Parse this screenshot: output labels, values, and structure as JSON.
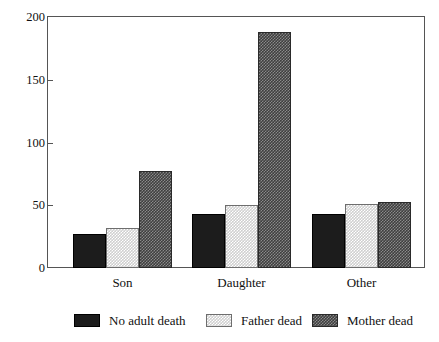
{
  "chart_data": {
    "type": "bar",
    "title": "",
    "xlabel": "",
    "ylabel": "",
    "categories": [
      "Son",
      "Daughter",
      "Other"
    ],
    "series": [
      {
        "name": "No adult death",
        "values": [
          27,
          43,
          43
        ],
        "color": "#1c1c1c",
        "fill": "solid-black"
      },
      {
        "name": "Father dead",
        "values": [
          32,
          50,
          51
        ],
        "color": "#cfcfcf",
        "fill": "light-gray-checker"
      },
      {
        "name": "Mother dead",
        "values": [
          77,
          188,
          53
        ],
        "color": "#3f3f3f",
        "fill": "dark-gray-checker"
      }
    ],
    "ylim": [
      0,
      200
    ],
    "yticks": [
      0,
      50,
      100,
      150,
      200
    ],
    "ytick_labels": [
      "0",
      "50",
      "100",
      "150",
      "200"
    ],
    "grid": false,
    "legend_position": "bottom"
  },
  "axis": {
    "ticks": [
      {
        "label": "200",
        "value": 200
      },
      {
        "label": "150",
        "value": 150
      },
      {
        "label": "100",
        "value": 100
      },
      {
        "label": "50",
        "value": 50
      },
      {
        "label": "0",
        "value": 0
      }
    ]
  },
  "legend": {
    "items": [
      {
        "label": "No adult death"
      },
      {
        "label": "Father dead"
      },
      {
        "label": "Mother dead"
      }
    ]
  },
  "title_remnant": ""
}
